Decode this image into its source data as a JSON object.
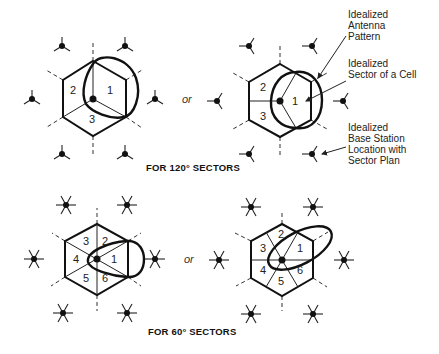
{
  "figure": {
    "panels": [
      {
        "id": "120-a",
        "sectors": [
          "1",
          "2",
          "3"
        ]
      },
      {
        "id": "120-b",
        "sectors": [
          "1",
          "2",
          "3"
        ]
      },
      {
        "id": "60-a",
        "sectors": [
          "1",
          "2",
          "3",
          "4",
          "5",
          "6"
        ]
      },
      {
        "id": "60-b",
        "sectors": [
          "1",
          "2",
          "3",
          "4",
          "5",
          "6"
        ]
      }
    ],
    "or_label": "or",
    "caption_120": "FOR 120° SECTORS",
    "caption_60": "FOR 60° SECTORS",
    "legend": {
      "antenna_pattern": [
        "Idealized",
        "Antenna",
        "Pattern"
      ],
      "sector_of_cell": [
        "Idealized",
        "Sector of a Cell"
      ],
      "base_station": [
        "Idealized",
        "Base Station",
        "Location with",
        "Sector Plan"
      ]
    }
  }
}
